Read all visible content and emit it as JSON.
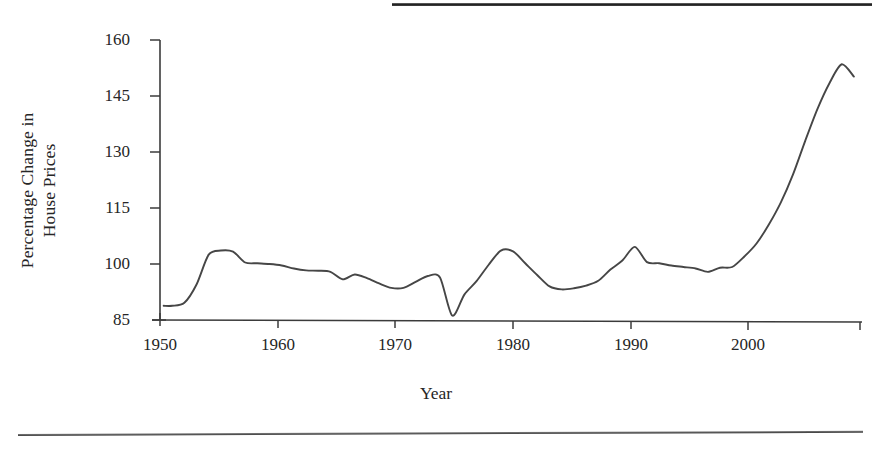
{
  "figure": {
    "rule_top": "horizontal-rule",
    "rule_bottom": "horizontal-rule"
  },
  "chart_data": {
    "type": "line",
    "title": "",
    "xlabel": "Year",
    "ylabel": "Percentage Change in\nHouse Prices",
    "xlim": [
      1950,
      2007.5
    ],
    "ylim": [
      85,
      160
    ],
    "xticks": [
      1950,
      1960,
      1970,
      1980,
      1990,
      2000
    ],
    "xtick_labels": [
      "1950",
      "1960",
      "1970",
      "1980",
      "1990",
      "2000"
    ],
    "yticks": [
      85,
      100,
      115,
      130,
      145,
      160
    ],
    "ytick_labels": [
      "85",
      "100",
      "115",
      "130",
      "145",
      "160"
    ],
    "grid": false,
    "legend": false,
    "line_color": "#464646",
    "series": [
      {
        "name": "Percentage Change in House Prices",
        "x": [
          1950.3,
          1951,
          1952,
          1953,
          1954,
          1955,
          1956,
          1957,
          1958,
          1959,
          1960,
          1961,
          1962,
          1963,
          1964,
          1965,
          1966,
          1967,
          1968,
          1969,
          1970,
          1971,
          1972,
          1973,
          1974,
          1975,
          1976,
          1977,
          1978,
          1979,
          1980,
          1981,
          1982,
          1983,
          1984,
          1985,
          1986,
          1987,
          1988,
          1989,
          1990,
          1991,
          1992,
          1993,
          1994,
          1995,
          1996,
          1997,
          1998,
          1999,
          2000,
          2001,
          2002,
          2003,
          2004,
          2005,
          2006,
          2007
        ],
        "values": [
          88.8,
          88.8,
          89.6,
          94.5,
          102.5,
          103.6,
          103.3,
          100.4,
          100.2,
          100.0,
          99.6,
          98.8,
          98.3,
          98.2,
          97.9,
          95.9,
          97.2,
          96.2,
          94.8,
          93.6,
          93.6,
          95.2,
          96.8,
          96.4,
          86.2,
          91.8,
          95.4,
          99.8,
          103.6,
          103.4,
          100.2,
          97.0,
          94.0,
          93.2,
          93.5,
          94.2,
          95.5,
          98.5,
          101.0,
          104.6,
          100.5,
          100.2,
          99.6,
          99.2,
          98.8,
          97.9,
          99.0,
          99.2,
          102.0,
          105.5,
          110.5,
          116.5,
          124.0,
          133.0,
          141.5,
          148.5,
          153.5,
          150.2
        ]
      }
    ]
  }
}
